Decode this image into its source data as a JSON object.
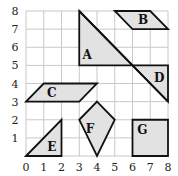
{
  "diagram": {
    "type": "coordinate-grid",
    "x_range": [
      0,
      8
    ],
    "y_range": [
      0,
      8
    ],
    "x_ticks": [
      "0",
      "1",
      "2",
      "3",
      "4",
      "5",
      "6",
      "7",
      "8"
    ],
    "y_ticks": [
      "1",
      "2",
      "3",
      "4",
      "5",
      "6",
      "7",
      "8"
    ],
    "colors": {
      "grid": "#c8c8c8",
      "fill": "#e2e2e2",
      "stroke": "#111111"
    },
    "shapes": [
      {
        "label": "A",
        "kind": "right-triangle",
        "points": [
          [
            3,
            8
          ],
          [
            3,
            5
          ],
          [
            6,
            5
          ]
        ],
        "label_at": [
          3.45,
          5.55
        ]
      },
      {
        "label": "B",
        "kind": "parallelogram",
        "points": [
          [
            5,
            8
          ],
          [
            7,
            8
          ],
          [
            8,
            7
          ],
          [
            6,
            7
          ]
        ],
        "label_at": [
          6.6,
          7.45
        ]
      },
      {
        "label": "C",
        "kind": "parallelogram",
        "points": [
          [
            1,
            4
          ],
          [
            4,
            4
          ],
          [
            3,
            3
          ],
          [
            0,
            3
          ]
        ],
        "label_at": [
          1.45,
          3.45
        ]
      },
      {
        "label": "D",
        "kind": "right-triangle",
        "points": [
          [
            6,
            5
          ],
          [
            8,
            5
          ],
          [
            8,
            3
          ]
        ],
        "label_at": [
          7.5,
          4.3
        ]
      },
      {
        "label": "E",
        "kind": "right-triangle",
        "points": [
          [
            0,
            0
          ],
          [
            2,
            2
          ],
          [
            2,
            0
          ]
        ],
        "label_at": [
          1.45,
          0.45
        ]
      },
      {
        "label": "F",
        "kind": "kite",
        "points": [
          [
            4,
            3
          ],
          [
            5,
            2
          ],
          [
            4,
            0
          ],
          [
            3,
            2
          ]
        ],
        "label_at": [
          3.6,
          1.45
        ]
      },
      {
        "label": "G",
        "kind": "square",
        "points": [
          [
            6,
            2
          ],
          [
            8,
            2
          ],
          [
            8,
            0
          ],
          [
            6,
            0
          ]
        ],
        "label_at": [
          6.55,
          1.4
        ]
      }
    ],
    "extra_lines": [
      {
        "from": [
          3,
          8
        ],
        "to": [
          8,
          3
        ]
      }
    ]
  }
}
